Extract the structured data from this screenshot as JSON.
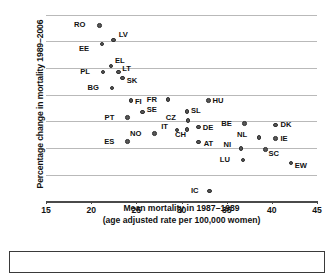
{
  "chart_data": {
    "type": "scatter",
    "title": "",
    "xlabel_line1": "Mean mortality in 1987–1989",
    "xlabel_line2": "(age adjusted rate per 100,000 women)",
    "ylabel": "Percentage change in mortality 1989–2006",
    "xlim": [
      15,
      45
    ],
    "ylim": [
      -50,
      20
    ],
    "xticks": [
      15,
      20,
      25,
      30,
      35,
      40,
      45
    ],
    "yticks": [
      20,
      10,
      0,
      -10,
      -20,
      -30,
      -40,
      -50
    ],
    "xtick_labels": [
      "15",
      "20",
      "25",
      "30",
      "35",
      "40",
      "45"
    ],
    "ytick_labels": [
      "20",
      "10",
      "0",
      "−10",
      "−20",
      "−30",
      "−40",
      "−50"
    ],
    "grid": "horizontal",
    "legend": "none",
    "marker_color": "#575757",
    "points": [
      {
        "label": "RO",
        "x": 20.9,
        "y": 16.0,
        "lx": -15,
        "ly": -4
      },
      {
        "label": "LV",
        "x": 22.5,
        "y": 10.5,
        "lx": 5,
        "ly": -9
      },
      {
        "label": "EE",
        "x": 21.2,
        "y": 9.0,
        "lx": -14,
        "ly": 1
      },
      {
        "label": "EL",
        "x": 22.2,
        "y": 0.7,
        "lx": 4,
        "ly": -9
      },
      {
        "label": "PL",
        "x": 21.3,
        "y": -1.5,
        "lx": -14,
        "ly": -4
      },
      {
        "label": "LT",
        "x": 23.0,
        "y": -1.5,
        "lx": 4,
        "ly": -7
      },
      {
        "label": "SK",
        "x": 23.5,
        "y": -3.8,
        "lx": 4,
        "ly": -1
      },
      {
        "label": "BG",
        "x": 22.3,
        "y": -7.5,
        "lx": -14,
        "ly": -4
      },
      {
        "label": "FI",
        "x": 24.4,
        "y": -12.3,
        "lx": 4,
        "ly": -3
      },
      {
        "label": "FR",
        "x": 28.5,
        "y": -11.8,
        "lx": -12,
        "ly": -3
      },
      {
        "label": "HU",
        "x": 33.0,
        "y": -12.3,
        "lx": 4,
        "ly": -4
      },
      {
        "label": "SE",
        "x": 25.7,
        "y": -16.6,
        "lx": 4,
        "ly": -6
      },
      {
        "label": "SL",
        "x": 30.6,
        "y": -16.4,
        "lx": 4,
        "ly": -5
      },
      {
        "label": "PT",
        "x": 24.0,
        "y": -18.6,
        "lx": -14,
        "ly": -4
      },
      {
        "label": "CZ",
        "x": 30.7,
        "y": -19.7,
        "lx": -13,
        "ly": -6
      },
      {
        "label": "BE",
        "x": 37.0,
        "y": -20.9,
        "lx": -14,
        "ly": -4
      },
      {
        "label": "DK",
        "x": 40.4,
        "y": -21.4,
        "lx": 5,
        "ly": -4
      },
      {
        "label": "DE",
        "x": 31.9,
        "y": -22.1,
        "lx": 4,
        "ly": -3
      },
      {
        "label": "CH",
        "x": 30.6,
        "y": -23.2,
        "lx": -2,
        "ly": 1
      },
      {
        "label": "IT",
        "x": 29.5,
        "y": -23.3,
        "lx": -10,
        "ly": -7
      },
      {
        "label": "NO",
        "x": 27.0,
        "y": -24.6,
        "lx": -14,
        "ly": -4
      },
      {
        "label": "NL",
        "x": 38.6,
        "y": -26.1,
        "lx": -13,
        "ly": -7
      },
      {
        "label": "IE",
        "x": 40.4,
        "y": -26.4,
        "lx": 5,
        "ly": -3
      },
      {
        "label": "AT",
        "x": 31.9,
        "y": -27.8,
        "lx": 5,
        "ly": -2
      },
      {
        "label": "ES",
        "x": 24.0,
        "y": -27.7,
        "lx": -14,
        "ly": -4
      },
      {
        "label": "NI",
        "x": 36.6,
        "y": -30.3,
        "lx": -11,
        "ly": -8
      },
      {
        "label": "SC",
        "x": 39.3,
        "y": -30.6,
        "lx": 3,
        "ly": 0
      },
      {
        "label": "LU",
        "x": 36.8,
        "y": -34.6,
        "lx": -14,
        "ly": -4
      },
      {
        "label": "EW",
        "x": 42.1,
        "y": -35.7,
        "lx": 4,
        "ly": -1
      },
      {
        "label": "IC",
        "x": 33.1,
        "y": -46.2,
        "lx": -12,
        "ly": -4
      }
    ]
  }
}
